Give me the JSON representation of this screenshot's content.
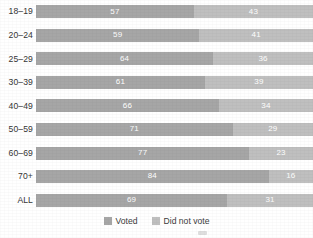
{
  "chart_data": {
    "type": "bar",
    "title": "",
    "subtitle": "",
    "xlabel": "",
    "ylabel": "",
    "orientation": "horizontal",
    "stacked": true,
    "stack_total": 100,
    "xlim": [
      0,
      100
    ],
    "grid": false,
    "legend_position": "bottom",
    "categories": [
      "18–19",
      "20–24",
      "25–29",
      "30–39",
      "40–49",
      "50–59",
      "60–69",
      "70+",
      "ALL"
    ],
    "series": [
      {
        "name": "Voted",
        "color": "#a6a6a6",
        "values": [
          57,
          59,
          64,
          61,
          66,
          71,
          77,
          84,
          69
        ]
      },
      {
        "name": "Did not vote",
        "color": "#bfbfbf",
        "values": [
          43,
          41,
          36,
          39,
          34,
          29,
          23,
          16,
          31
        ]
      }
    ],
    "tick_labels": [
      "18–19",
      "20–24",
      "25–29",
      "30–39",
      "40–49",
      "50–59",
      "60–69",
      "70+",
      "ALL"
    ],
    "legend_entries": [
      "Voted",
      "Did not vote"
    ],
    "annotations": []
  },
  "legend": {
    "items": [
      {
        "label": "Voted",
        "color": "#a6a6a6"
      },
      {
        "label": "Did not vote",
        "color": "#bfbfbf"
      }
    ]
  },
  "colors": {
    "voted": "#a6a6a6",
    "did_not_vote": "#bfbfbf",
    "text": "#3c3c3c",
    "value_text": "#ffffff",
    "background": "#ffffff"
  }
}
